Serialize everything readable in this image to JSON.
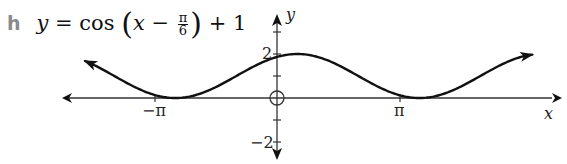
{
  "title": {
    "part_label": "h",
    "equation_lhs": "y",
    "equation_eq": " = cos ",
    "equation_inner_var": "x",
    "equation_minus": " − ",
    "frac_num": "π",
    "frac_den": "6",
    "equation_tail": " + 1"
  },
  "chart_data": {
    "type": "line",
    "xlabel": "x",
    "ylabel": "y",
    "x_ticks": [
      {
        "value": -3.14159,
        "label": "−π"
      },
      {
        "value": 3.14159,
        "label": "π"
      }
    ],
    "y_ticks": [
      {
        "value": 2,
        "label": "2"
      },
      {
        "value": -2,
        "label": "−2"
      }
    ],
    "y_tick_marks": [
      -3,
      -2,
      -1,
      1,
      2,
      3
    ],
    "xlim": [
      -5.6,
      7.1
    ],
    "ylim": [
      -2.8,
      3
    ],
    "grid": false,
    "legend": null,
    "series": [
      {
        "name": "y = cos(x − π/6) + 1",
        "function": "cos(x - pi/6) + 1",
        "x_range": [
          -4.94,
          6.57
        ],
        "key_points": [
          {
            "x": -5.76,
            "y": 2,
            "note": "max (off-plot)"
          },
          {
            "x": -2.618,
            "y": 0,
            "note": "min at x = −5π/6"
          },
          {
            "x": 0,
            "y": 1.866
          },
          {
            "x": 0.5236,
            "y": 2,
            "note": "max at x = π/6"
          },
          {
            "x": 3.665,
            "y": 0,
            "note": "min at x = 7π/6"
          }
        ],
        "arrows_at_ends": true
      }
    ],
    "origin_marker": "circle"
  },
  "axes": {
    "x_label": "x",
    "y_label": "y",
    "x_tick_neg_pi": "−π",
    "x_tick_pi": "π",
    "y_tick_2": "2",
    "y_tick_neg2": "−2"
  },
  "colors": {
    "curve": "#111111",
    "axes": "#333333",
    "label_gray": "#8a8a8a"
  }
}
